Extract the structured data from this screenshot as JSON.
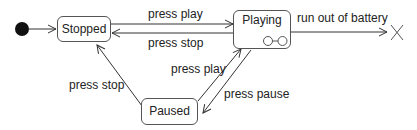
{
  "diagram": {
    "type": "state-machine",
    "initial": "Stopped",
    "states": [
      {
        "id": "stopped",
        "label": "Stopped"
      },
      {
        "id": "playing",
        "label": "Playing",
        "composite": true
      },
      {
        "id": "paused",
        "label": "Paused"
      }
    ],
    "final_marker": "terminate (X)",
    "transitions": [
      {
        "from": "initial",
        "to": "stopped",
        "label": ""
      },
      {
        "from": "stopped",
        "to": "playing",
        "label": "press play"
      },
      {
        "from": "playing",
        "to": "stopped",
        "label": "press stop"
      },
      {
        "from": "paused",
        "to": "stopped",
        "label": "press stop"
      },
      {
        "from": "paused",
        "to": "playing",
        "label": "press play"
      },
      {
        "from": "playing",
        "to": "paused",
        "label": "press pause"
      },
      {
        "from": "playing",
        "to": "terminate",
        "label": "run out of battery"
      }
    ]
  }
}
